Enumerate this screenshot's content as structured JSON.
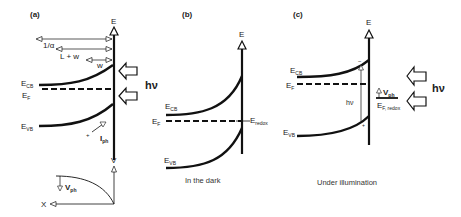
{
  "panels": {
    "a": {
      "label": "(a)",
      "axis_label": "E",
      "arrows": [
        "1/α",
        "L + w",
        "w"
      ],
      "ecb_main": "E",
      "ecb_sub": "CB",
      "ef_main": "E",
      "ef_sub": "F",
      "evb_main": "E",
      "evb_sub": "VB",
      "iph_main": "I",
      "iph_sub": "ph",
      "plus": "+",
      "light": "hν",
      "inset": {
        "y_axis": "V",
        "x_axis": "X",
        "vph_main": "V",
        "vph_sub": "ph"
      }
    },
    "b": {
      "label": "(b)",
      "axis_label": "E",
      "ecb_main": "E",
      "ecb_sub": "CB",
      "ef_main": "E",
      "ef_sub": "F",
      "evb_main": "E",
      "evb_sub": "VB",
      "eredox_main": "E",
      "eredox_sub": "redox",
      "caption": "In the dark"
    },
    "c": {
      "label": "(c)",
      "axis_label": "E",
      "ecb_main": "E",
      "ecb_sub": "CB",
      "ef_main": "E",
      "ef_sub": "F",
      "evb_main": "E",
      "evb_sub": "VB",
      "hv_gap": "hν",
      "minus": "−",
      "plus": "+",
      "vph_main": "V",
      "vph_sub": "ph",
      "efredox_main": "E",
      "efredox_sub": "F, redox",
      "light": "hν",
      "caption": "Under illumination"
    }
  },
  "colors": {
    "ink": "#111111",
    "background": "#ffffff"
  }
}
